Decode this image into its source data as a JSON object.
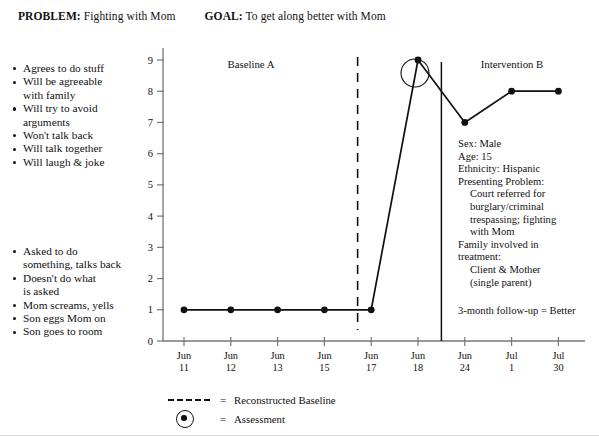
{
  "header": {
    "problem_label": "PROBLEM:",
    "problem_text": "Fighting with Mom",
    "goal_label": "GOAL:",
    "goal_text": "To get along better with Mom"
  },
  "goals_list": [
    {
      "text": "Agrees to do stuff",
      "continuation": false
    },
    {
      "text": "Will be agreeable",
      "continuation": false
    },
    {
      "text": "with family",
      "continuation": true
    },
    {
      "text": "Will try to avoid",
      "continuation": false
    },
    {
      "text": "arguments",
      "continuation": true
    },
    {
      "text": "Won't talk back",
      "continuation": false
    },
    {
      "text": "Will talk together",
      "continuation": false
    },
    {
      "text": "Will laugh & joke",
      "continuation": false
    }
  ],
  "problems_list": [
    {
      "text": "Asked to do",
      "continuation": false
    },
    {
      "text": "something, talks back",
      "continuation": true
    },
    {
      "text": "Doesn't do what",
      "continuation": false
    },
    {
      "text": "is asked",
      "continuation": true
    },
    {
      "text": "Mom screams, yells",
      "continuation": false
    },
    {
      "text": "Son eggs Mom on",
      "continuation": false
    },
    {
      "text": "Son goes to room",
      "continuation": false
    }
  ],
  "case_info": {
    "lines": [
      {
        "text": "Sex:  Male",
        "indent": false
      },
      {
        "text": "Age:  15",
        "indent": false
      },
      {
        "text": "Ethnicity:  Hispanic",
        "indent": false
      },
      {
        "text": "Presenting Problem:",
        "indent": false
      },
      {
        "text": "Court referred for",
        "indent": true
      },
      {
        "text": "burglary/criminal",
        "indent": true
      },
      {
        "text": "trespassing; fighting",
        "indent": true
      },
      {
        "text": "with Mom",
        "indent": true
      },
      {
        "text": "Family involved in",
        "indent": false
      },
      {
        "text": "treatment:",
        "indent": false
      },
      {
        "text": "Client & Mother",
        "indent": true
      },
      {
        "text": "(single parent)",
        "indent": true
      }
    ],
    "followup": "3-month follow-up = Better"
  },
  "legend": {
    "reconstructed_baseline_eq": "=",
    "reconstructed_baseline": "Reconstructed Baseline",
    "assessment_eq": "=",
    "assessment": "Assessment"
  },
  "chart_data": {
    "type": "line",
    "title": "",
    "xlabel": "",
    "ylabel": "",
    "ylim": [
      0,
      9
    ],
    "yticks": [
      0,
      1,
      2,
      3,
      4,
      5,
      6,
      7,
      8,
      9
    ],
    "ytick_labels": [
      "0",
      "1",
      "2",
      "3",
      "4",
      "5",
      "6",
      "7",
      "8",
      "9"
    ],
    "grid": false,
    "legend_position": "below-axis",
    "categories": [
      "Jun 11",
      "Jun 12",
      "Jun 13",
      "Jun 15",
      "Jun 17",
      "Jun 18",
      "Jun 24",
      "Jul 1",
      "Jul 30"
    ],
    "xtick_labels": [
      {
        "top": "Jun",
        "bottom": "11"
      },
      {
        "top": "Jun",
        "bottom": "12"
      },
      {
        "top": "Jun",
        "bottom": "13"
      },
      {
        "top": "Jun",
        "bottom": "15"
      },
      {
        "top": "Jun",
        "bottom": "17"
      },
      {
        "top": "Jun",
        "bottom": "18"
      },
      {
        "top": "Jun",
        "bottom": "24"
      },
      {
        "top": "Jul",
        "bottom": "1"
      },
      {
        "top": "Jul",
        "bottom": "30"
      }
    ],
    "values": [
      1,
      1,
      1,
      1,
      1,
      9,
      7,
      8,
      8
    ],
    "assessment_points": [
      "Jun 18"
    ],
    "phases": [
      {
        "label": "Baseline A",
        "start": "Jun 11",
        "end": "Jun 17"
      },
      {
        "label": "Intervention B",
        "start": "Jun 18",
        "end": "Jul 30"
      }
    ],
    "phase_lines": [
      {
        "after": "Jun 15",
        "style": "dashed"
      },
      {
        "after": "Jun 18",
        "style": "solid"
      }
    ]
  },
  "colors": {
    "ink": "#111111",
    "axis": "#777777"
  }
}
